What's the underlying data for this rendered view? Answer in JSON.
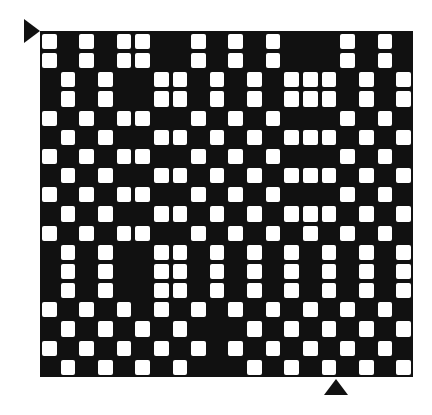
{
  "colors": {
    "warp": "#111111",
    "weft": "#ffffff"
  },
  "grid": {
    "columns": 20,
    "rows": 18,
    "legend": "1 = white (weft up), 0 = black (warp up)",
    "pattern": [
      "10101100101010001010",
      "10101100101010001010",
      "01010011010101110101",
      "01010011010101110101",
      "10101100101010001010",
      "01010011010101110101",
      "10101100101010001010",
      "01010011010101110101",
      "10101100101010001010",
      "01010011010101110101",
      "10101100101010101010",
      "01010011010101010101",
      "01010011010101010101",
      "01010011010101010101",
      "10101010101010101010",
      "01010101000101010101",
      "10101010101010101010",
      "01010101000101010101"
    ]
  },
  "markers": [
    {
      "name": "start-row-marker",
      "shape": "triangle-right",
      "position": "top-left"
    },
    {
      "name": "start-column-marker",
      "shape": "triangle-up",
      "position": "bottom"
    }
  ]
}
